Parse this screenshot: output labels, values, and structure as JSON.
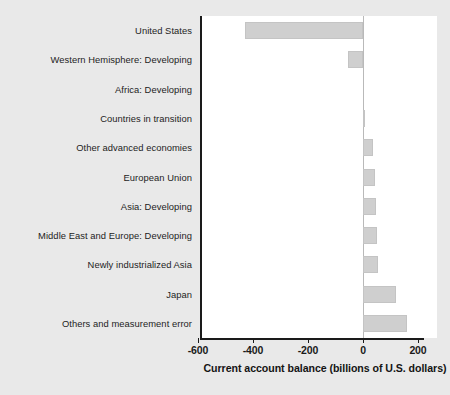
{
  "chart_data": {
    "type": "bar",
    "orientation": "horizontal",
    "title": "",
    "xlabel": "Current account balance (billions of U.S. dollars)",
    "ylabel": "",
    "xlim": [
      -600,
      280
    ],
    "xticks": [
      -600,
      -400,
      -200,
      0,
      200
    ],
    "xticklabels": [
      "-600",
      "-400",
      "-200",
      "0",
      "200"
    ],
    "grid": false,
    "legend": null,
    "zero_reference_line": true,
    "bar_color": "#cfcfcf",
    "categories": [
      "United States",
      "Western Hemisphere: Developing",
      "Africa: Developing",
      "Countries in transition",
      "Other advanced economies",
      "European Union",
      "Asia: Developing",
      "Middle East and Europe: Developing",
      "Newly industrialized Asia",
      "Japan",
      "Others and measurement error"
    ],
    "values": [
      -430,
      -55,
      0,
      5,
      37,
      45,
      48,
      50,
      55,
      120,
      160
    ]
  },
  "axis": {
    "x_title": "Current account balance (billions of U.S. dollars)",
    "tick_labels": [
      "-600",
      "-400",
      "-200",
      "0",
      "200"
    ]
  },
  "footer": {
    "source_sliver": ""
  }
}
